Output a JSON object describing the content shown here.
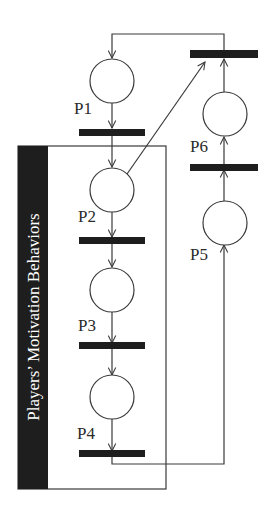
{
  "diagram": {
    "type": "petri-net",
    "colors": {
      "line": "#3a3a3a",
      "bar": "#1e1e1e",
      "label_bg": "#1e1e1e",
      "label_text": "#ffffff",
      "background": "#ffffff"
    },
    "group_label": "Players’ Motivation Behaviors",
    "places": [
      {
        "id": "P1",
        "label": "P1"
      },
      {
        "id": "P2",
        "label": "P2"
      },
      {
        "id": "P3",
        "label": "P3"
      },
      {
        "id": "P4",
        "label": "P4"
      },
      {
        "id": "P5",
        "label": "P5"
      },
      {
        "id": "P6",
        "label": "P6"
      }
    ],
    "transitions": [
      "T1",
      "T2",
      "T3",
      "T4",
      "T5",
      "T6"
    ],
    "arcs": [
      {
        "from": "P1",
        "to": "T1"
      },
      {
        "from": "T1",
        "to": "P2"
      },
      {
        "from": "P2",
        "to": "T2"
      },
      {
        "from": "T2",
        "to": "P3"
      },
      {
        "from": "P3",
        "to": "T3"
      },
      {
        "from": "T3",
        "to": "P4"
      },
      {
        "from": "P4",
        "to": "T4"
      },
      {
        "from": "T4",
        "to": "P5"
      },
      {
        "from": "P5",
        "to": "T5"
      },
      {
        "from": "T5",
        "to": "P6"
      },
      {
        "from": "P6",
        "to": "T6"
      },
      {
        "from": "P2",
        "to": "T6"
      },
      {
        "from": "T6",
        "to": "P1"
      }
    ]
  }
}
